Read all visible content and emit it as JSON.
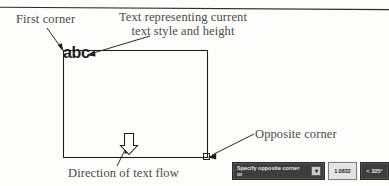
{
  "figure": {
    "callouts": {
      "first_corner": "First corner",
      "text_style_line1": "Text representing current",
      "text_style_line2": "text style and height",
      "opposite_corner": "Opposite corner",
      "text_flow": "Direction of text flow"
    },
    "sample_text": "abc",
    "colors": {
      "ink": "#1d1d1d",
      "label_ink": "#4a4a48",
      "tooltip_bg": "#3d3d3d",
      "tooltip_fg": "#e8e8e8",
      "field_bg": "#e3e3e3",
      "paper": "#fdfdfb"
    }
  },
  "dynamic_input": {
    "prompt": "Specify opposite corner or",
    "options_icon": "chevron-down-icon",
    "options_glyph": "▾",
    "length_value": "1.0832",
    "angle_prefix": "<",
    "angle_value": "325°"
  }
}
